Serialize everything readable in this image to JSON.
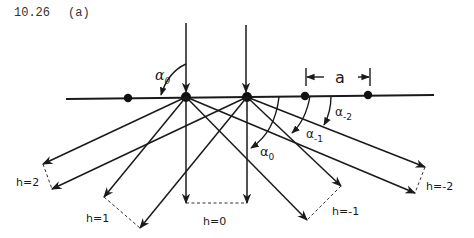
{
  "header": {
    "problem_label": "10.26",
    "part_label": "(a)"
  },
  "labels": {
    "alpha_top": "α",
    "alpha_top_sub": "0",
    "alpha_0": "α",
    "alpha_0_sub": "0",
    "alpha_m1": "α",
    "alpha_m1_sub": "-1",
    "alpha_m2": "α",
    "alpha_m2_sub": "-2",
    "spacing": "a",
    "h2": "h=2",
    "h1": "h=1",
    "h0": "h=0",
    "hm1": "h=-1",
    "hm2": "h=-2"
  },
  "colors": {
    "ink": "#1a1a1a",
    "background": "#ffffff"
  }
}
